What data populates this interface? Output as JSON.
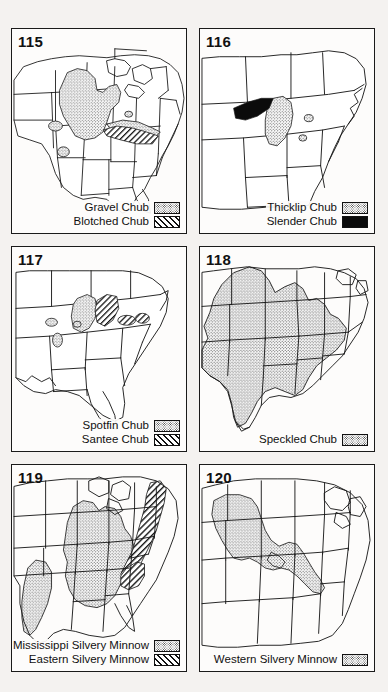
{
  "figure": {
    "layout": "2 columns x 3 rows of range maps",
    "panel_count": 6
  },
  "patterns": {
    "stipple": "fine dotted / stippled shading",
    "hatch": "diagonal line hatching",
    "solid": "solid black fill"
  },
  "colors": {
    "page_background": "#f4f2f0",
    "panel_background": "#fdfcfb",
    "ink": "#111111",
    "stipple_fill": "#c9c9c9",
    "solid_fill": "#0b0b0b"
  },
  "panels": [
    {
      "number": "115",
      "map_name": "eastern-united-states-range-map",
      "legend": [
        {
          "label": "Gravel Chub",
          "pattern": "stipple"
        },
        {
          "label": "Blotched Chub",
          "pattern": "hatch"
        }
      ]
    },
    {
      "number": "116",
      "map_name": "eastern-united-states-range-map",
      "legend": [
        {
          "label": "Thicklip Chub",
          "pattern": "stipple"
        },
        {
          "label": "Slender Chub",
          "pattern": "solid"
        }
      ]
    },
    {
      "number": "117",
      "map_name": "southeastern-united-states-range-map",
      "legend": [
        {
          "label": "Spotfin Chub",
          "pattern": "stipple"
        },
        {
          "label": "Santee Chub",
          "pattern": "hatch"
        }
      ]
    },
    {
      "number": "118",
      "map_name": "central-united-states-range-map",
      "legend": [
        {
          "label": "Speckled Chub",
          "pattern": "stipple"
        }
      ]
    },
    {
      "number": "119",
      "map_name": "eastern-united-states-range-map",
      "legend": [
        {
          "label": "Mississippi Silvery Minnow",
          "pattern": "stipple"
        },
        {
          "label": "Eastern Silvery Minnow",
          "pattern": "hatch"
        }
      ]
    },
    {
      "number": "120",
      "map_name": "central-united-states-range-map",
      "legend": [
        {
          "label": "Western Silvery Minnow",
          "pattern": "stipple"
        }
      ]
    }
  ]
}
